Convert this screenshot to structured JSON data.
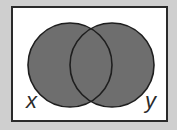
{
  "diagram": {
    "type": "venn",
    "shaded_region": "union",
    "sets": [
      {
        "name": "x",
        "label": "x"
      },
      {
        "name": "y",
        "label": "y"
      }
    ],
    "colors": {
      "background": "#cfcfcf",
      "frame_fill": "#ffffff",
      "frame_stroke": "#2a2a2a",
      "circle_fill": "#6e6e6e",
      "circle_stroke": "#1e1e1e"
    }
  }
}
